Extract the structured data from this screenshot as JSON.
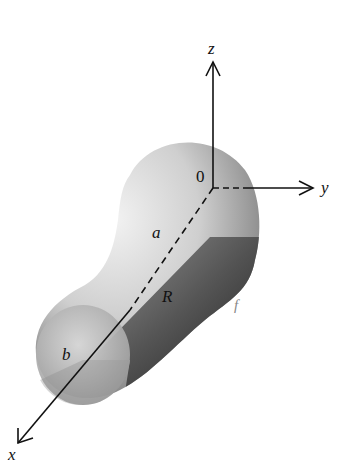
{
  "diagram": {
    "axes": {
      "z": {
        "label": "z"
      },
      "y": {
        "label": "y"
      },
      "x": {
        "label": "x"
      },
      "origin": {
        "label": "0"
      }
    },
    "labels": {
      "a": "a",
      "b": "b",
      "R": "R",
      "f": "f"
    },
    "colors": {
      "light_surface": "#d8d8d8",
      "dark_surface": "#3a3a3a",
      "axis": "#111111"
    }
  }
}
